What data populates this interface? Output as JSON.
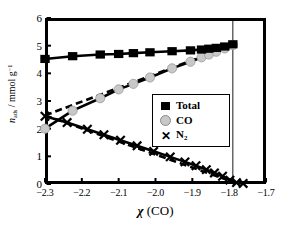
{
  "chart_data": {
    "type": "scatter",
    "title": "",
    "xlabel": "χ (CO)",
    "ylabel": "n_ads / mmol g^-1",
    "xlim": [
      -2.3,
      -1.7
    ],
    "ylim": [
      0,
      6
    ],
    "xticks": [
      "−2.3",
      "−2.2",
      "−2.1",
      "−2.0",
      "−1.9",
      "−1.8",
      "−1.7"
    ],
    "xtick_values": [
      -2.3,
      -2.2,
      -2.1,
      -2.0,
      -1.9,
      -1.8,
      -1.7
    ],
    "yticks": [
      "0",
      "1",
      "2",
      "3",
      "4",
      "5",
      "6"
    ],
    "ytick_values": [
      0,
      1,
      2,
      3,
      4,
      5,
      6
    ],
    "grid": false,
    "legend_position": "center-right",
    "colors": {
      "total": "#000000",
      "co": "#c8c8c8",
      "n2": "#000000",
      "frame": "#000000"
    },
    "vertical_marker_x": -1.79,
    "series": [
      {
        "name": "Total",
        "marker": "filled-square",
        "color": "#000000",
        "line": "solid",
        "x": [
          -2.3,
          -2.225,
          -2.15,
          -2.1,
          -2.06,
          -2.015,
          -1.955,
          -1.905,
          -1.875,
          -1.855,
          -1.835,
          -1.812,
          -1.79
        ],
        "values": [
          4.52,
          4.62,
          4.68,
          4.7,
          4.73,
          4.76,
          4.8,
          4.83,
          4.86,
          4.89,
          4.92,
          4.97,
          5.05
        ]
      },
      {
        "name": "CO",
        "marker": "filled-circle-gray",
        "color": "#c8c8c8",
        "line": "solid",
        "x": [
          -2.3,
          -2.225,
          -2.15,
          -2.1,
          -2.06,
          -2.015,
          -1.955,
          -1.905,
          -1.875,
          -1.855,
          -1.835,
          -1.812,
          -1.79
        ],
        "values": [
          2.0,
          2.65,
          3.1,
          3.42,
          3.62,
          3.85,
          4.18,
          4.42,
          4.58,
          4.68,
          4.78,
          4.9,
          5.02
        ]
      },
      {
        "name": "N2",
        "marker": "x-cross",
        "color": "#000000",
        "line": "solid",
        "x": [
          -2.3,
          -2.24,
          -2.185,
          -2.14,
          -2.095,
          -2.05,
          -2.005,
          -1.96,
          -1.92,
          -1.89,
          -1.862,
          -1.84,
          -1.818,
          -1.798,
          -1.78,
          -1.762
        ],
        "values": [
          2.45,
          2.22,
          1.98,
          1.78,
          1.58,
          1.38,
          1.18,
          0.98,
          0.8,
          0.66,
          0.52,
          0.4,
          0.28,
          0.14,
          0.05,
          0.02
        ]
      }
    ],
    "fit_lines": [
      {
        "name": "CO ideal",
        "style": "dashed",
        "color": "#000000",
        "x": [
          -2.3,
          -1.79
        ],
        "values": [
          2.48,
          5.02
        ]
      },
      {
        "name": "N2 ideal",
        "style": "dashed",
        "color": "#000000",
        "x": [
          -2.3,
          -1.782
        ],
        "values": [
          2.48,
          0.04
        ]
      }
    ],
    "legend": [
      {
        "label": "Total",
        "symbol": "filled-square"
      },
      {
        "label": "CO",
        "symbol": "filled-circle-gray"
      },
      {
        "label": "N₂",
        "symbol": "x-cross"
      }
    ]
  }
}
